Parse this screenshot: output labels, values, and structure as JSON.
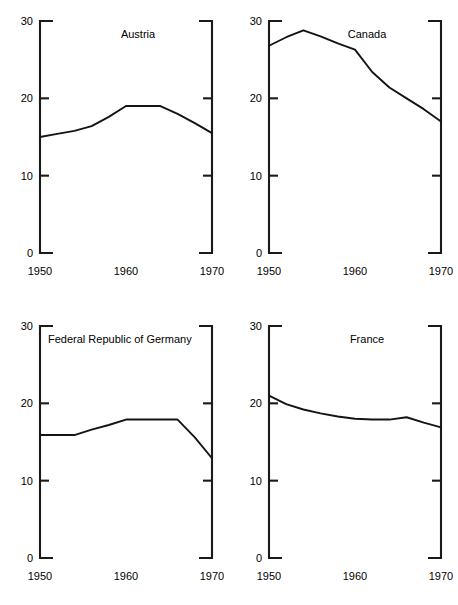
{
  "figure": {
    "background_color": "#ffffff",
    "line_color": "#141414",
    "axis_color": "#1a1a1a",
    "panel_count": 4
  },
  "chart_data": [
    {
      "type": "line",
      "title": "Austria",
      "xlabel": "",
      "ylabel": "",
      "xlim": [
        1950,
        1970
      ],
      "ylim": [
        0,
        30
      ],
      "yticks": [
        0,
        10,
        20,
        30
      ],
      "ytick_labels": [
        "0",
        "10",
        "20",
        "30"
      ],
      "xticks": [
        1950,
        1960,
        1970
      ],
      "xtick_labels": [
        "1950",
        "1960",
        "1970"
      ],
      "grid": false,
      "legend": "none",
      "x": [
        1950,
        1952,
        1954,
        1956,
        1958,
        1960,
        1962,
        1964,
        1966,
        1968,
        1970
      ],
      "values": [
        15.0,
        15.4,
        15.8,
        16.4,
        17.6,
        19.0,
        19.0,
        19.0,
        18.0,
        16.8,
        15.5
      ]
    },
    {
      "type": "line",
      "title": "Canada",
      "xlabel": "",
      "ylabel": "",
      "xlim": [
        1950,
        1970
      ],
      "ylim": [
        0,
        30
      ],
      "yticks": [
        0,
        10,
        20,
        30
      ],
      "ytick_labels": [
        "0",
        "10",
        "20",
        "30"
      ],
      "xticks": [
        1950,
        1960,
        1970
      ],
      "xtick_labels": [
        "1950",
        "1960",
        "1970"
      ],
      "grid": false,
      "legend": "none",
      "x": [
        1950,
        1952,
        1954,
        1956,
        1958,
        1960,
        1962,
        1964,
        1966,
        1968,
        1970
      ],
      "values": [
        26.8,
        27.9,
        28.8,
        28.0,
        27.1,
        26.3,
        23.4,
        21.4,
        20.0,
        18.6,
        17.0
      ]
    },
    {
      "type": "line",
      "title": "Federal Republic of Germany",
      "xlabel": "",
      "ylabel": "",
      "xlim": [
        1950,
        1970
      ],
      "ylim": [
        0,
        30
      ],
      "yticks": [
        0,
        10,
        20,
        30
      ],
      "ytick_labels": [
        "0",
        "10",
        "20",
        "30"
      ],
      "xticks": [
        1950,
        1960,
        1970
      ],
      "xtick_labels": [
        "1950",
        "1960",
        "1970"
      ],
      "grid": false,
      "legend": "none",
      "x": [
        1950,
        1952,
        1954,
        1956,
        1958,
        1960,
        1962,
        1964,
        1966,
        1968,
        1970
      ],
      "values": [
        15.9,
        15.9,
        15.9,
        16.6,
        17.2,
        17.9,
        17.9,
        17.9,
        17.9,
        15.6,
        12.9
      ]
    },
    {
      "type": "line",
      "title": "France",
      "xlabel": "",
      "ylabel": "",
      "xlim": [
        1950,
        1970
      ],
      "ylim": [
        0,
        30
      ],
      "yticks": [
        0,
        10,
        20,
        30
      ],
      "ytick_labels": [
        "0",
        "10",
        "20",
        "30"
      ],
      "xticks": [
        1950,
        1960,
        1970
      ],
      "xtick_labels": [
        "1950",
        "1960",
        "1970"
      ],
      "grid": false,
      "legend": "none",
      "x": [
        1950,
        1952,
        1954,
        1956,
        1958,
        1960,
        1962,
        1964,
        1966,
        1968,
        1970
      ],
      "values": [
        21.0,
        19.9,
        19.2,
        18.7,
        18.3,
        18.0,
        17.9,
        17.9,
        18.2,
        17.5,
        16.9
      ]
    }
  ]
}
